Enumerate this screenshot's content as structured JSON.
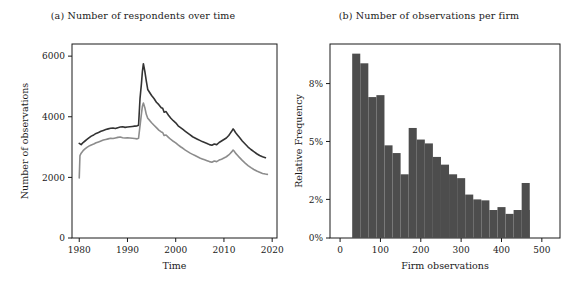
{
  "figure": {
    "background": "#ffffff",
    "panels": [
      {
        "tag": "(a)",
        "title": "(a) Number of respondents over time"
      },
      {
        "tag": "(b)",
        "title": "(b) Number of observations per firm"
      }
    ]
  },
  "chart_data": [
    {
      "type": "line",
      "title": "(a) Number of respondents over time",
      "xlabel": "Time",
      "ylabel": "Number of observations",
      "xlim": [
        1978.5,
        2021.0
      ],
      "ylim": [
        0,
        6400
      ],
      "xticks": [
        1980,
        1990,
        2000,
        2010,
        2020
      ],
      "xtick_labels": [
        "1980",
        "1990",
        "2000",
        "2010",
        "2020"
      ],
      "yticks": [
        0,
        2000,
        4000,
        6000
      ],
      "ytick_labels": [
        "0",
        "2000",
        "4000",
        "6000"
      ],
      "grid": false,
      "legend": "none",
      "series": [
        {
          "name": "all respondents",
          "color": "#333333",
          "x": [
            1980.0,
            1980.4,
            1980.8,
            1981.2,
            1981.6,
            1982.0,
            1982.5,
            1983.0,
            1983.5,
            1984.0,
            1984.5,
            1985.0,
            1985.5,
            1986.0,
            1986.5,
            1987.0,
            1987.5,
            1988.0,
            1988.5,
            1989.0,
            1989.5,
            1990.0,
            1990.5,
            1991.0,
            1991.5,
            1992.0,
            1992.3,
            1992.6,
            1992.9,
            1993.1,
            1993.3,
            1993.6,
            1993.9,
            1994.2,
            1994.6,
            1995.0,
            1995.5,
            1996.0,
            1996.5,
            1997.0,
            1997.3,
            1997.6,
            1998.0,
            1998.5,
            1999.0,
            1999.5,
            2000.0,
            2000.5,
            2001.0,
            2001.5,
            2002.0,
            2002.5,
            2003.0,
            2003.5,
            2004.0,
            2004.5,
            2005.0,
            2005.5,
            2006.0,
            2006.5,
            2007.0,
            2007.5,
            2008.0,
            2008.5,
            2009.0,
            2009.5,
            2010.0,
            2010.5,
            2011.0,
            2011.3,
            2011.6,
            2011.9,
            2012.1,
            2012.4,
            2012.8,
            2013.2,
            2013.8,
            2014.4,
            2015.0,
            2015.6,
            2016.2,
            2016.8,
            2017.4,
            2018.0,
            2018.6,
            2019.0
          ],
          "y": [
            3120,
            3080,
            3150,
            3200,
            3250,
            3300,
            3360,
            3400,
            3450,
            3480,
            3520,
            3550,
            3580,
            3600,
            3620,
            3630,
            3610,
            3640,
            3660,
            3670,
            3650,
            3660,
            3670,
            3680,
            3690,
            3700,
            3720,
            4600,
            5100,
            5500,
            5750,
            5500,
            5180,
            4900,
            4800,
            4700,
            4600,
            4480,
            4400,
            4300,
            4280,
            4150,
            4170,
            4050,
            3950,
            3870,
            3800,
            3700,
            3640,
            3580,
            3520,
            3460,
            3400,
            3340,
            3300,
            3260,
            3220,
            3180,
            3150,
            3120,
            3080,
            3060,
            3100,
            3080,
            3150,
            3200,
            3250,
            3300,
            3380,
            3450,
            3520,
            3600,
            3560,
            3480,
            3400,
            3320,
            3200,
            3100,
            3000,
            2920,
            2850,
            2780,
            2720,
            2680,
            2650
          ]
        },
        {
          "name": "matched sample",
          "color": "#8c8c8c",
          "x": [
            1980.0,
            1980.15,
            1980.4,
            1980.8,
            1981.2,
            1981.6,
            1982.0,
            1982.5,
            1983.0,
            1983.5,
            1984.0,
            1984.5,
            1985.0,
            1985.5,
            1986.0,
            1986.5,
            1987.0,
            1987.5,
            1988.0,
            1988.5,
            1989.0,
            1989.5,
            1990.0,
            1990.5,
            1991.0,
            1991.5,
            1992.0,
            1992.3,
            1992.6,
            1992.9,
            1993.1,
            1993.3,
            1993.6,
            1993.9,
            1994.2,
            1994.6,
            1995.0,
            1995.5,
            1996.0,
            1996.5,
            1997.0,
            1997.3,
            1997.6,
            1998.0,
            1998.5,
            1999.0,
            1999.5,
            2000.0,
            2000.5,
            2001.0,
            2001.5,
            2002.0,
            2002.5,
            2003.0,
            2003.5,
            2004.0,
            2004.5,
            2005.0,
            2005.5,
            2006.0,
            2006.5,
            2007.0,
            2007.5,
            2008.0,
            2008.5,
            2009.0,
            2009.5,
            2010.0,
            2010.5,
            2011.0,
            2011.3,
            2011.6,
            2011.9,
            2012.1,
            2012.4,
            2012.8,
            2013.2,
            2013.8,
            2014.4,
            2015.0,
            2015.6,
            2016.2,
            2016.8,
            2017.4,
            2018.0,
            2018.6,
            2019.0
          ],
          "y": [
            1980,
            2720,
            2800,
            2880,
            2940,
            2990,
            3030,
            3070,
            3100,
            3140,
            3170,
            3200,
            3230,
            3250,
            3270,
            3290,
            3280,
            3300,
            3320,
            3330,
            3310,
            3300,
            3310,
            3300,
            3290,
            3280,
            3270,
            3290,
            3700,
            4100,
            4350,
            4450,
            4300,
            4080,
            3950,
            3880,
            3800,
            3720,
            3640,
            3560,
            3500,
            3480,
            3380,
            3400,
            3320,
            3250,
            3190,
            3140,
            3070,
            3010,
            2960,
            2900,
            2850,
            2800,
            2760,
            2720,
            2680,
            2640,
            2610,
            2580,
            2550,
            2520,
            2500,
            2540,
            2520,
            2570,
            2600,
            2640,
            2680,
            2740,
            2790,
            2840,
            2900,
            2870,
            2800,
            2730,
            2660,
            2560,
            2470,
            2390,
            2320,
            2260,
            2210,
            2170,
            2130,
            2110,
            2100
          ]
        }
      ]
    },
    {
      "type": "bar",
      "title": "(b) Number of observations per firm",
      "xlabel": "Firm observations",
      "ylabel": "Relative Frequency",
      "xlim": [
        -25,
        545
      ],
      "ylim": [
        0,
        0.1005
      ],
      "xticks": [
        0,
        100,
        200,
        300,
        400,
        500
      ],
      "xtick_labels": [
        "0",
        "100",
        "200",
        "300",
        "400",
        "500"
      ],
      "yticks": [
        0,
        0.02,
        0.05,
        0.08
      ],
      "ytick_labels": [
        "0%",
        "2%",
        "5%",
        "8%"
      ],
      "grid": false,
      "legend": "none",
      "bin_width": 20,
      "bin_starts": [
        30,
        50,
        70,
        90,
        110,
        130,
        150,
        170,
        190,
        210,
        230,
        250,
        270,
        290,
        310,
        330,
        350,
        370,
        390,
        410,
        430,
        450
      ],
      "values": [
        0.0955,
        0.0905,
        0.073,
        0.074,
        0.048,
        0.044,
        0.033,
        0.057,
        0.051,
        0.049,
        0.042,
        0.038,
        0.033,
        0.031,
        0.0225,
        0.02,
        0.0195,
        0.0145,
        0.016,
        0.0125,
        0.0145,
        0.0145
      ],
      "last_bar": {
        "start": 450,
        "width": 20,
        "value": 0.0285
      },
      "bar_color": "#4d4d4d"
    }
  ]
}
